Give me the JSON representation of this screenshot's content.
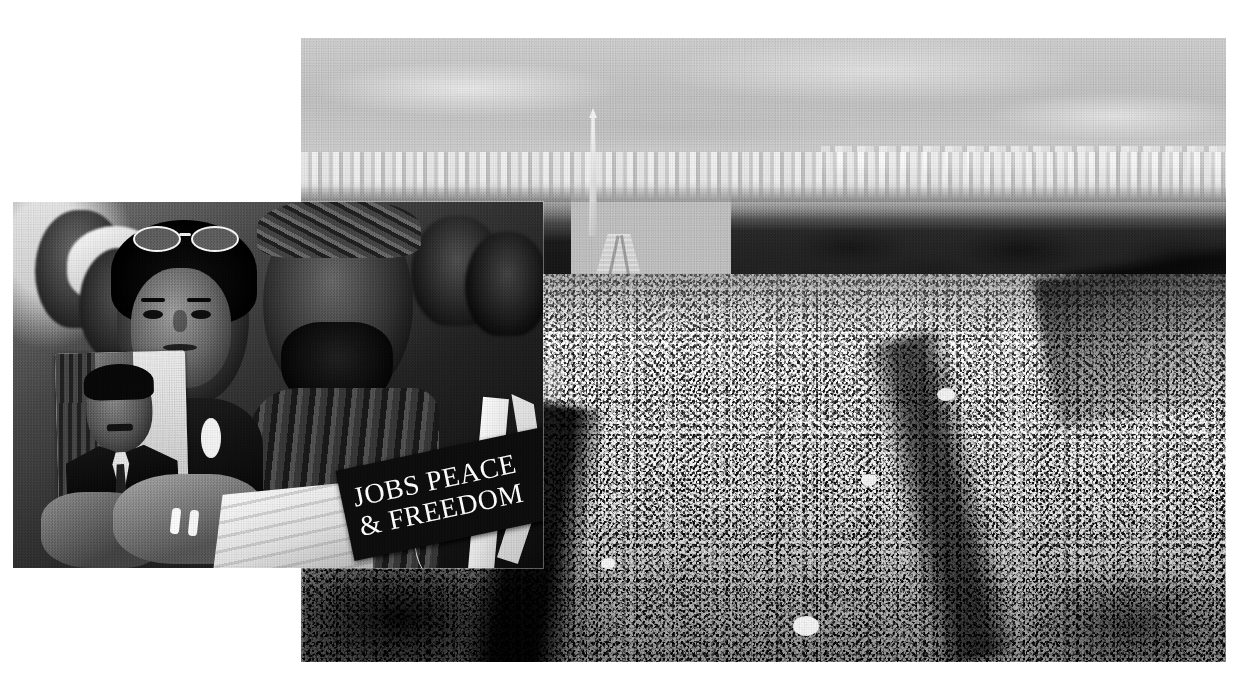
{
  "page": {
    "title": "March on Washington for Jobs and Freedom — photo montage",
    "background_color": "#ffffff",
    "width": 1252,
    "height": 674,
    "treatment": "black-and-white halftone print"
  },
  "photos": {
    "aerial": {
      "name": "aerial-view-national-mall",
      "description": "Aerial black-and-white photograph of the National Mall filled with a massive crowd, looking toward the Washington Monument",
      "landmarks": {
        "monument": "Washington Monument",
        "pool": "Reflecting Pool",
        "trees": "Tree lines flanking the Mall",
        "skyline": "Distant Washington D.C. skyline",
        "crowd": "Crowd of demonstrators"
      },
      "frame": {
        "left": 301,
        "top": 38,
        "width": 925,
        "height": 624
      }
    },
    "foreground": {
      "name": "demonstrators-close-up",
      "description": "Close-up black-and-white photograph of demonstrators; a young woman with sunglasses pushed up on her head, a bearded man in a head wrap, a child resting on a barrier",
      "frame": {
        "left": 13,
        "top": 202,
        "width": 530,
        "height": 366
      },
      "elements": {
        "placard": "Portrait placard of Dr. Martin Luther King Jr. in a suit and tie",
        "hands": "Hands with wedding rings holding the placard",
        "cloth": "White folded cloth"
      }
    }
  },
  "sign": {
    "name": "protest-banner",
    "line1": "JOBS PEACE",
    "line2": "& FREEDOM",
    "background_color": "#191919",
    "text_color": "#f6f6f6",
    "rotation_deg": -12
  },
  "colors": {
    "page_background": "#ffffff",
    "sky": "#c6c6c6",
    "crowd_mid": "#9a9a9a",
    "tree_dark": "#1c1c1c",
    "banner_dark": "#191919",
    "banner_text": "#f6f6f6",
    "monument_light": "#f3f3f3",
    "pool_water": "#cfcfcf"
  }
}
